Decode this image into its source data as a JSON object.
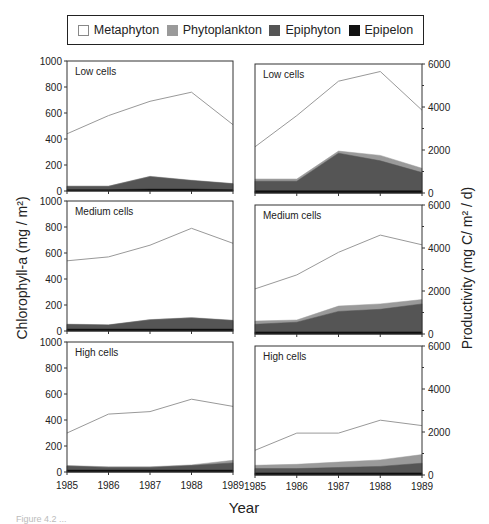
{
  "legend": {
    "items": [
      {
        "label": "Metaphyton",
        "color": "#ffffff",
        "border": "#888888"
      },
      {
        "label": "Phytoplankton",
        "color": "#9a9a9a",
        "border": "#9a9a9a"
      },
      {
        "label": "Epiphyton",
        "color": "#555555",
        "border": "#555555"
      },
      {
        "label": "Epipelon",
        "color": "#111111",
        "border": "#111111"
      }
    ]
  },
  "caption": "Figure 4.2 ...",
  "chart_data": [
    {
      "type": "area",
      "stacked": true,
      "title": "Low cells",
      "xlabel": "Year",
      "ylabel": "Chlorophyll-a (mg / m²)",
      "x": [
        1985,
        1986,
        1987,
        1988,
        1989
      ],
      "ylim": [
        0,
        1000
      ],
      "yticks": [
        0,
        200,
        400,
        600,
        800,
        1000
      ],
      "series": [
        {
          "name": "Epipelon",
          "values": [
            10,
            10,
            15,
            15,
            10
          ]
        },
        {
          "name": "Epiphyton",
          "values": [
            25,
            25,
            95,
            65,
            45
          ]
        },
        {
          "name": "Phytoplankton",
          "values": [
            3,
            3,
            3,
            3,
            3
          ]
        },
        {
          "name": "Metaphyton",
          "values": [
            402,
            542,
            577,
            677,
            452
          ]
        }
      ]
    },
    {
      "type": "area",
      "stacked": true,
      "title": "Low cells",
      "xlabel": "Year",
      "ylabel": "Productivity (mg C/ m² / d)",
      "x": [
        1985,
        1986,
        1987,
        1988,
        1989
      ],
      "ylim": [
        0,
        6000
      ],
      "yticks": [
        0,
        2000,
        4000,
        6000
      ],
      "series": [
        {
          "name": "Epipelon",
          "values": [
            100,
            100,
            100,
            100,
            100
          ]
        },
        {
          "name": "Epiphyton",
          "values": [
            450,
            450,
            1750,
            1400,
            850
          ]
        },
        {
          "name": "Phytoplankton",
          "values": [
            100,
            100,
            100,
            250,
            200
          ]
        },
        {
          "name": "Metaphyton",
          "values": [
            1500,
            2950,
            3250,
            3900,
            2700
          ]
        }
      ]
    },
    {
      "type": "area",
      "stacked": true,
      "title": "Medium cells",
      "xlabel": "Year",
      "ylabel": "Chlorophyll-a (mg / m²)",
      "x": [
        1985,
        1986,
        1987,
        1988,
        1989
      ],
      "ylim": [
        0,
        1000
      ],
      "yticks": [
        0,
        200,
        400,
        600,
        800,
        1000
      ],
      "series": [
        {
          "name": "Epipelon",
          "values": [
            15,
            15,
            15,
            15,
            15
          ]
        },
        {
          "name": "Epiphyton",
          "values": [
            35,
            30,
            70,
            85,
            65
          ]
        },
        {
          "name": "Phytoplankton",
          "values": [
            3,
            3,
            3,
            3,
            3
          ]
        },
        {
          "name": "Metaphyton",
          "values": [
            487,
            522,
            572,
            687,
            592
          ]
        }
      ]
    },
    {
      "type": "area",
      "stacked": true,
      "title": "Medium cells",
      "xlabel": "Year",
      "ylabel": "Productivity (mg C/ m² / d)",
      "x": [
        1985,
        1986,
        1987,
        1988,
        1989
      ],
      "ylim": [
        0,
        6000
      ],
      "yticks": [
        0,
        2000,
        4000,
        6000
      ],
      "series": [
        {
          "name": "Epipelon",
          "values": [
            100,
            100,
            100,
            100,
            100
          ]
        },
        {
          "name": "Epiphyton",
          "values": [
            350,
            450,
            950,
            1050,
            1300
          ]
        },
        {
          "name": "Phytoplankton",
          "values": [
            150,
            100,
            250,
            250,
            200
          ]
        },
        {
          "name": "Metaphyton",
          "values": [
            1500,
            2100,
            2500,
            3200,
            2550
          ]
        }
      ]
    },
    {
      "type": "area",
      "stacked": true,
      "title": "High cells",
      "xlabel": "Year",
      "ylabel": "Chlorophyll-a (mg / m²)",
      "x": [
        1985,
        1986,
        1987,
        1988,
        1989
      ],
      "ylim": [
        0,
        1000
      ],
      "yticks": [
        0,
        200,
        400,
        600,
        800,
        1000
      ],
      "series": [
        {
          "name": "Epipelon",
          "values": [
            15,
            15,
            15,
            15,
            15
          ]
        },
        {
          "name": "Epiphyton",
          "values": [
            30,
            20,
            20,
            35,
            55
          ]
        },
        {
          "name": "Phytoplankton",
          "values": [
            5,
            5,
            5,
            5,
            20
          ]
        },
        {
          "name": "Metaphyton",
          "values": [
            250,
            405,
            425,
            505,
            415
          ]
        }
      ]
    },
    {
      "type": "area",
      "stacked": true,
      "title": "High cells",
      "xlabel": "Year",
      "ylabel": "Productivity (mg C/ m² / d)",
      "x": [
        1985,
        1986,
        1987,
        1988,
        1989
      ],
      "ylim": [
        0,
        6000
      ],
      "yticks": [
        0,
        2000,
        4000,
        6000
      ],
      "series": [
        {
          "name": "Epipelon",
          "values": [
            100,
            100,
            100,
            100,
            100
          ]
        },
        {
          "name": "Epiphyton",
          "values": [
            200,
            200,
            250,
            300,
            450
          ]
        },
        {
          "name": "Phytoplankton",
          "values": [
            150,
            200,
            250,
            300,
            400
          ]
        },
        {
          "name": "Metaphyton",
          "values": [
            700,
            1450,
            1350,
            1850,
            1350
          ]
        }
      ]
    }
  ],
  "axes": {
    "xlabel": "Year",
    "ylabel_left": "Chlorophyll-a (mg / m²)",
    "ylabel_right": "Productivity (mg C/ m² / d)"
  },
  "colors": {
    "Metaphyton": "#ffffff",
    "Phytoplankton": "#9a9a9a",
    "Epiphyton": "#555555",
    "Epipelon": "#111111",
    "metaphyton_line": "#999999"
  }
}
